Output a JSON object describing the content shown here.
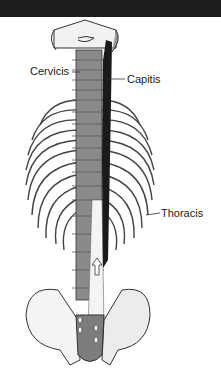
{
  "figure": {
    "labels": {
      "cervicis": "Cervicis",
      "capitis": "Capitis",
      "thoracis": "Thoracis"
    },
    "colors": {
      "background": "#ffffff",
      "top_bar": "#1c1c1c",
      "bone_light": "#f2f2f2",
      "vertebra": "#8a8a8a",
      "muscle": "#1a1a1a",
      "outline": "#333333"
    }
  }
}
